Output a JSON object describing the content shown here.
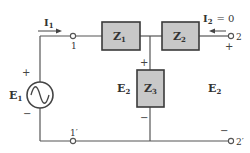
{
  "diagram": {
    "type": "two-port network circuit",
    "components": {
      "Z1": {
        "label": "Z",
        "sub": "1"
      },
      "Z2": {
        "label": "Z",
        "sub": "2"
      },
      "Z3": {
        "label": "Z",
        "sub": "3"
      }
    },
    "source": {
      "label": "E",
      "sub": "1",
      "symbol": "ac-source",
      "plus": "+",
      "minus": "−"
    },
    "current_in": {
      "label": "I",
      "sub": "1"
    },
    "current_out": {
      "label": "I",
      "sub": "2",
      "eq": "= 0"
    },
    "terminals": {
      "t1": "1",
      "t1p": "1′",
      "t2": "2",
      "t2p": "2′"
    },
    "voltage_mid": {
      "label": "E",
      "sub": "2",
      "plus": "+",
      "minus": "−"
    },
    "voltage_out": {
      "label": "E",
      "sub": "2",
      "plus": "+",
      "minus": "−"
    },
    "colors": {
      "wire": "#555555",
      "box_fill": "#c8c8c8",
      "box_stroke": "#3a3a3a",
      "text": "#333333"
    }
  }
}
